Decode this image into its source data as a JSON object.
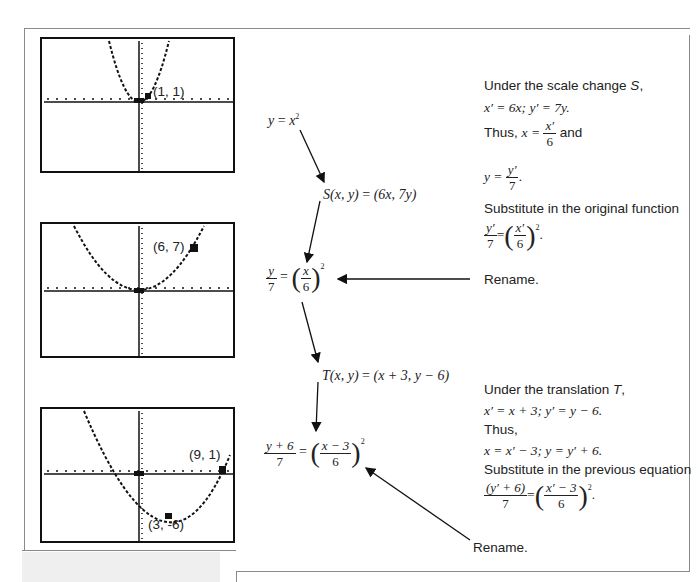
{
  "frame": {
    "border_color": "#8a8a8a"
  },
  "graphs": [
    {
      "id": "graph-1",
      "equation": "y = x^2",
      "point_label": "(1, 1)",
      "point": [
        1,
        1
      ]
    },
    {
      "id": "graph-2",
      "equation": "y/7 = (x/6)^2",
      "point_label": "(6, 7)",
      "point": [
        6,
        7
      ]
    },
    {
      "id": "graph-3",
      "equation": "(y+6)/7 = ((x-3)/6)^2",
      "point_labels": [
        "(9, 1)",
        "(3, -6)"
      ],
      "points": [
        [
          9,
          1
        ],
        [
          3,
          -6
        ]
      ]
    }
  ],
  "flow": {
    "eq1": {
      "lhs": "y",
      "eq": " = ",
      "rhs": "x",
      "exp": "2"
    },
    "scale": {
      "name": "S",
      "args": "(x, y)",
      "eq": " = ",
      "result": "(6x, 7y)"
    },
    "eq2": {
      "lhs_num": "y",
      "lhs_den": "7",
      "eq": "=",
      "rhs_num": "x",
      "rhs_den": "6",
      "exp": "2"
    },
    "translation": {
      "name": "T",
      "args": "(x, y)",
      "eq": " = ",
      "result": "(x + 3, y − 6)"
    },
    "eq3": {
      "lhs_num": "y + 6",
      "lhs_den": "7",
      "eq": "=",
      "rhs_num": "x − 3",
      "rhs_den": "6",
      "exp": "2"
    }
  },
  "notes": {
    "scale": {
      "line1_a": "Under the scale change ",
      "line1_b": "S",
      "line1_c": ",",
      "line2": "x′ = 6x; y′ = 7y.",
      "line3_a": "Thus, ",
      "line3_b": "x = ",
      "line3_num": "x′",
      "line3_den": "6",
      "line3_c": " and",
      "line4_a": "y = ",
      "line4_num": "y′",
      "line4_den": "7",
      "line4_c": ".",
      "line5": "Substitute in the original function",
      "line6_lnum": "y′",
      "line6_lden": "7",
      "line6_eq": "=",
      "line6_rnum": "x′",
      "line6_rden": "6",
      "line6_exp": "2",
      "line6_end": ".",
      "rename": "Rename."
    },
    "translation": {
      "line1_a": "Under the translation ",
      "line1_b": "T",
      "line1_c": ",",
      "line2": "x′ = x + 3; y′ = y − 6.",
      "line3": "Thus,",
      "line4": "x = x′ − 3; y = y′ + 6.",
      "line5": "Substitute in the previous equation",
      "line6_lnum": "(y′ + 6)",
      "line6_lden": "7",
      "line6_eq": "=",
      "line6_rnum": "x′ − 3",
      "line6_rden": "6",
      "line6_exp": "2",
      "line6_end": ".",
      "rename": "Rename."
    }
  }
}
